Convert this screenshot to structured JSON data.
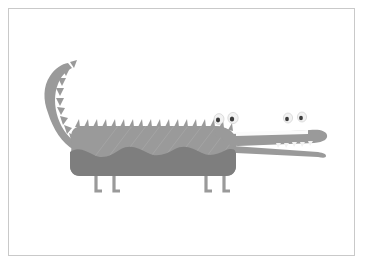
{
  "artwork": {
    "title": "Crocodile illustration",
    "subject": "crocodile",
    "style": "flat grayscale vector cartoon",
    "background_color": "#ffffff",
    "frame": {
      "border_color": "#c9c9c9",
      "border_width_px": 1,
      "inset_px": 8
    },
    "palette": {
      "body_light": "#9a9a9a",
      "body_shade": "#8e8e8e",
      "belly_dark": "#7e7e7e",
      "leg_gray": "#9a9a9a",
      "eye_white": "#f2f2f2",
      "pupil_dark": "#3c3c3c",
      "mouth_gap": "#fbfbfb",
      "tooth_white": "#f2f2f2",
      "outline": "#c9c9c9"
    },
    "parts": [
      {
        "name": "tail",
        "description": "upward curving spiked tail at left"
      },
      {
        "name": "back-spikes",
        "description": "row of triangular dorsal scutes along the back"
      },
      {
        "name": "body",
        "description": "long rectangular body with rounded corners"
      },
      {
        "name": "belly",
        "description": "darker gray underside with wavy top edge"
      },
      {
        "name": "front-legs",
        "description": "pair of L-shaped front legs"
      },
      {
        "name": "hind-legs",
        "description": "pair of L-shaped hind legs"
      },
      {
        "name": "snout",
        "description": "long narrow snout with open mouth"
      },
      {
        "name": "lower-jaw",
        "description": "thin tapering lower jaw"
      },
      {
        "name": "eyes",
        "description": "four rounded eye bumps with dark pupils"
      },
      {
        "name": "teeth",
        "description": "small white teeth along the snout"
      }
    ],
    "counts": {
      "back_spikes": 18,
      "tail_spikes": 9,
      "eyes": 4,
      "legs": 4,
      "teeth": 8
    }
  }
}
